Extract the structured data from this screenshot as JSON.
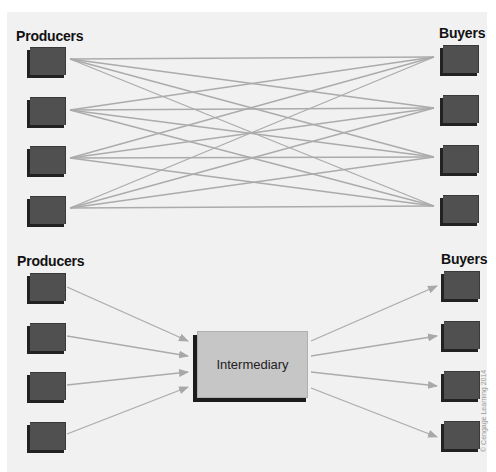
{
  "diagram": {
    "top": {
      "producers_label": "Producers",
      "buyers_label": "Buyers",
      "producer_count": 4,
      "buyer_count": 4,
      "connection_type": "every producer connected directly to every buyer (16 lines)"
    },
    "bottom": {
      "producers_label": "Producers",
      "buyers_label": "Buyers",
      "intermediary_label": "Intermediary",
      "producer_count": 4,
      "buyer_count": 4,
      "connection_type": "producers -> intermediary -> buyers (8 arrows)"
    },
    "copyright": "© Cengage Learning 2014",
    "colors": {
      "background": "#f1f1f1",
      "node": "#505050",
      "node_shadow": "#222222",
      "intermediary": "#c6c6c6",
      "line": "#aaaaaa"
    }
  }
}
